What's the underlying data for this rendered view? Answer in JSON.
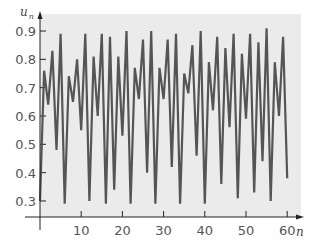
{
  "chart_data": {
    "type": "line",
    "title": "",
    "xlabel": "n",
    "ylabel": "u_n",
    "ylabel_main": "u",
    "ylabel_sub": "n",
    "xlim": [
      0,
      62
    ],
    "ylim": [
      0.25,
      0.94
    ],
    "grid": false,
    "legend": null,
    "xticks": [
      10,
      20,
      30,
      40,
      50,
      60
    ],
    "xtick_labels": [
      "10",
      "20",
      "30",
      "40",
      "50",
      "60"
    ],
    "yticks": [
      0.3,
      0.4,
      0.5,
      0.6,
      0.7,
      0.8,
      0.9
    ],
    "ytick_labels": [
      "0.3",
      "0.4",
      "0.5",
      "0.6",
      "0.7",
      "0.8",
      "0.9"
    ],
    "colors": {
      "line": "#555555",
      "plot_background": "#ebebeb",
      "axis": "#222222"
    },
    "x": [
      0,
      1,
      2,
      3,
      4,
      5,
      6,
      7,
      8,
      9,
      10,
      11,
      12,
      13,
      14,
      15,
      16,
      17,
      18,
      19,
      20,
      21,
      22,
      23,
      24,
      25,
      26,
      27,
      28,
      29,
      30,
      31,
      32,
      33,
      34,
      35,
      36,
      37,
      38,
      39,
      40,
      41,
      42,
      43,
      44,
      45,
      46,
      47,
      48,
      49,
      50,
      51,
      52,
      53,
      54,
      55,
      56,
      57,
      58,
      59,
      60
    ],
    "values": [
      0.3,
      0.76,
      0.64,
      0.83,
      0.48,
      0.89,
      0.29,
      0.74,
      0.65,
      0.8,
      0.55,
      0.89,
      0.3,
      0.81,
      0.6,
      0.89,
      0.29,
      0.88,
      0.34,
      0.81,
      0.53,
      0.9,
      0.29,
      0.77,
      0.66,
      0.87,
      0.4,
      0.9,
      0.29,
      0.77,
      0.66,
      0.87,
      0.42,
      0.89,
      0.29,
      0.75,
      0.68,
      0.85,
      0.46,
      0.9,
      0.29,
      0.79,
      0.62,
      0.88,
      0.36,
      0.84,
      0.56,
      0.89,
      0.31,
      0.82,
      0.59,
      0.89,
      0.33,
      0.86,
      0.44,
      0.91,
      0.3,
      0.79,
      0.6,
      0.88,
      0.38
    ]
  }
}
